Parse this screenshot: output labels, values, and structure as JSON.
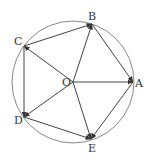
{
  "diagram": {
    "type": "geometry",
    "circle": {
      "cx": 73,
      "cy": 82,
      "r": 61,
      "color": "#888888"
    },
    "center": {
      "label": "O",
      "x": 73,
      "y": 82,
      "label_x": 62,
      "label_y": 86
    },
    "points": [
      {
        "label": "A",
        "x": 133,
        "y": 82,
        "label_x": 135,
        "label_y": 87
      },
      {
        "label": "B",
        "x": 92,
        "y": 24,
        "label_x": 88,
        "label_y": 20
      },
      {
        "label": "C",
        "x": 24,
        "y": 46,
        "label_x": 14,
        "label_y": 45
      },
      {
        "label": "D",
        "x": 24,
        "y": 117,
        "label_x": 14,
        "label_y": 124
      },
      {
        "label": "E",
        "x": 91,
        "y": 139,
        "label_x": 88,
        "label_y": 152
      }
    ],
    "vectors": [
      {
        "from": "O",
        "to": "A"
      },
      {
        "from": "O",
        "to": "B"
      },
      {
        "from": "O",
        "to": "C"
      },
      {
        "from": "O",
        "to": "D"
      },
      {
        "from": "O",
        "to": "E"
      },
      {
        "from": "C",
        "to": "B"
      },
      {
        "from": "C",
        "to": "D"
      },
      {
        "from": "D",
        "to": "E"
      },
      {
        "from": "B",
        "to": "A"
      },
      {
        "from": "A",
        "to": "E"
      }
    ],
    "line_color": "#444444"
  }
}
